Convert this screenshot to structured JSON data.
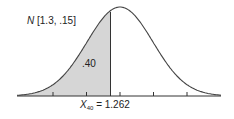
{
  "chart_data": {
    "type": "area",
    "title": "",
    "distribution": "Normal",
    "distribution_label": "N [1.3, .15]",
    "mean": 1.3,
    "sd": 0.15,
    "shaded_area": ".40",
    "shaded_region": "left tail up to X.40",
    "cutoff_label": "X.40 = 1.262",
    "cutoff_symbol": "X",
    "cutoff_subscript": "40",
    "cutoff_value": "1.262",
    "x_ticks_count": 5,
    "xlabel": "",
    "ylabel": "",
    "grid": false,
    "colors": {
      "shade": "#d6d6d6",
      "curve": "#444444",
      "axis": "#333333"
    }
  },
  "labels": {
    "dist_prefix": "N",
    "dist_params": " [1.3, .15]",
    "area": ".40",
    "x_symbol": "X",
    "x_sub": "40",
    "x_value": " = 1.262"
  }
}
